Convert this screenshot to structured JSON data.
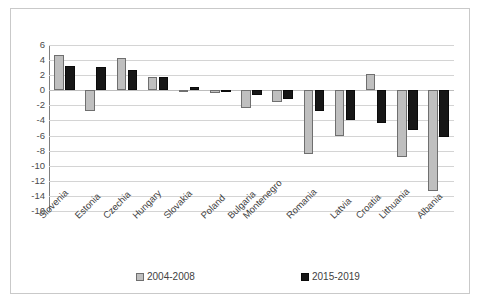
{
  "chart_data": {
    "type": "bar",
    "title": "",
    "subtitle": "",
    "xlabel": "",
    "ylabel": "",
    "ylim": [
      -16,
      6
    ],
    "ytick_step": 2,
    "yticks": [
      6,
      4,
      2,
      0,
      -2,
      -4,
      -6,
      -8,
      -10,
      -12,
      -14,
      -16
    ],
    "ytick_labels": [
      "6",
      "4",
      "2",
      "0",
      "-2",
      "-4",
      "-6",
      "-8",
      "-10",
      "-12",
      "-14",
      "-16"
    ],
    "grid": true,
    "grid_axis": "y",
    "legend_position": "bottom",
    "categories": [
      "Slovenia",
      "Estonia",
      "Czechia",
      "Hungary",
      "Slovakia",
      "Poland",
      "Bulgaria",
      "Montenegro",
      "Romania",
      "Latvia",
      "Croatia",
      "Lithuania",
      "Albania"
    ],
    "series": [
      {
        "name": "2004-2008",
        "color": "#bfbfbf",
        "edge_color": "#6f6f6f",
        "values": [
          4.7,
          -2.8,
          4.3,
          1.7,
          0.1,
          -0.4,
          -2.3,
          -1.5,
          -8.4,
          -6.0,
          2.2,
          -8.9,
          -13.4
        ]
      },
      {
        "name": "2015-2019",
        "color": "#171717",
        "edge_color": "#0b0b0b",
        "values": [
          3.2,
          3.1,
          2.7,
          1.8,
          0.5,
          0.1,
          -0.6,
          -1.2,
          -2.7,
          -4.0,
          -4.3,
          -5.2,
          -6.2
        ]
      }
    ]
  },
  "legend": {
    "items": [
      {
        "label": "2004-2008",
        "swatch": "series-1-swatch"
      },
      {
        "label": "2015-2019",
        "swatch": "series-2-swatch"
      }
    ]
  }
}
